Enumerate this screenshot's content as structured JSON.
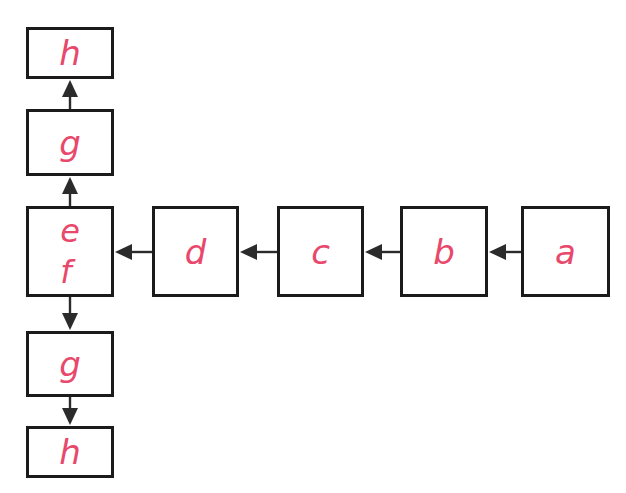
{
  "diagram": {
    "title": "",
    "background_color": "#ffffff",
    "box_border_color": "#1b1b1b",
    "label_color": "#e8486b",
    "arrow_color": "#2b2b2b",
    "nodes": [
      {
        "id": "h-top",
        "label": "h",
        "labels": [
          "h"
        ],
        "x": 26,
        "y": 27,
        "w": 88,
        "h": 52
      },
      {
        "id": "g-top",
        "label": "g",
        "labels": [
          "g"
        ],
        "x": 26,
        "y": 109,
        "w": 88,
        "h": 67
      },
      {
        "id": "ef",
        "label": "e f",
        "labels": [
          "e",
          "f"
        ],
        "x": 26,
        "y": 206,
        "w": 88,
        "h": 91
      },
      {
        "id": "g-bottom",
        "label": "g",
        "labels": [
          "g"
        ],
        "x": 26,
        "y": 331,
        "w": 88,
        "h": 66
      },
      {
        "id": "h-bottom",
        "label": "h",
        "labels": [
          "h"
        ],
        "x": 26,
        "y": 426,
        "w": 88,
        "h": 52
      },
      {
        "id": "d",
        "label": "d",
        "labels": [
          "d"
        ],
        "x": 152,
        "y": 206,
        "w": 87,
        "h": 91
      },
      {
        "id": "c",
        "label": "c",
        "labels": [
          "c"
        ],
        "x": 277,
        "y": 206,
        "w": 87,
        "h": 91
      },
      {
        "id": "b",
        "label": "b",
        "labels": [
          "b"
        ],
        "x": 400,
        "y": 206,
        "w": 88,
        "h": 91
      },
      {
        "id": "a",
        "label": "a",
        "labels": [
          "a"
        ],
        "x": 521,
        "y": 206,
        "w": 89,
        "h": 91
      }
    ],
    "edges": [
      {
        "id": "edge-g-top-to-h-top",
        "from": "g-top",
        "to": "h-top",
        "direction": "up"
      },
      {
        "id": "edge-ef-to-g-top",
        "from": "ef",
        "to": "g-top",
        "direction": "up"
      },
      {
        "id": "edge-ef-to-g-bottom",
        "from": "ef",
        "to": "g-bottom",
        "direction": "down"
      },
      {
        "id": "edge-g-bottom-to-h-bottom",
        "from": "g-bottom",
        "to": "h-bottom",
        "direction": "down"
      },
      {
        "id": "edge-d-to-ef",
        "from": "d",
        "to": "ef",
        "direction": "left"
      },
      {
        "id": "edge-c-to-d",
        "from": "c",
        "to": "d",
        "direction": "left"
      },
      {
        "id": "edge-b-to-c",
        "from": "b",
        "to": "c",
        "direction": "left"
      },
      {
        "id": "edge-a-to-b",
        "from": "a",
        "to": "b",
        "direction": "left"
      }
    ]
  }
}
